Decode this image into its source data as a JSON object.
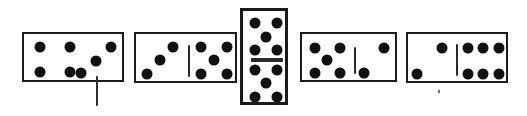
{
  "scene": {
    "width": 527,
    "height": 116,
    "background_color": "#ffffff",
    "ink_color": "#111111",
    "outline_color": "#1a1a1a",
    "title": "Row of five domino tiles",
    "tile_count": 5
  },
  "dominoes": [
    {
      "id": "domino-1",
      "orientation": "horizontal",
      "left_value": 4,
      "right_value": 3,
      "label": "4-3",
      "x": 22,
      "y": 32,
      "width": 102,
      "height": 50,
      "divider": {
        "x": 72,
        "y": 42,
        "length": 30
      },
      "pips": [
        {
          "half": "left",
          "x": 16,
          "y": 13,
          "r": 5.5
        },
        {
          "half": "left",
          "x": 46,
          "y": 13,
          "r": 5.5
        },
        {
          "half": "left",
          "x": 16,
          "y": 38,
          "r": 5.5
        },
        {
          "half": "left",
          "x": 46,
          "y": 38,
          "r": 5.5
        },
        {
          "half": "right",
          "x": 87,
          "y": 13,
          "r": 5.5
        },
        {
          "half": "right",
          "x": 72,
          "y": 27,
          "r": 5.5
        },
        {
          "half": "right",
          "x": 57,
          "y": 39,
          "r": 5.5
        }
      ]
    },
    {
      "id": "domino-2",
      "orientation": "horizontal",
      "left_value": 3,
      "right_value": 5,
      "label": "3-5",
      "x": 134,
      "y": 32,
      "width": 103,
      "height": 51,
      "divider": {
        "x": 52,
        "y": 11,
        "length": 32
      },
      "pips": [
        {
          "half": "left",
          "x": 37,
          "y": 13,
          "r": 5.5
        },
        {
          "half": "left",
          "x": 24,
          "y": 26,
          "r": 5.5
        },
        {
          "half": "left",
          "x": 11,
          "y": 40,
          "r": 5.5
        },
        {
          "half": "right",
          "x": 65,
          "y": 13,
          "r": 5.5
        },
        {
          "half": "right",
          "x": 91,
          "y": 13,
          "r": 5.5
        },
        {
          "half": "right",
          "x": 78,
          "y": 26,
          "r": 5.5
        },
        {
          "half": "right",
          "x": 65,
          "y": 40,
          "r": 5.5
        },
        {
          "half": "right",
          "x": 91,
          "y": 40,
          "r": 5.5
        }
      ]
    },
    {
      "id": "domino-3",
      "orientation": "vertical",
      "left_value": 5,
      "right_value": 5,
      "label": "5-5",
      "x": 240,
      "y": 8,
      "width": 48,
      "height": 97,
      "divider": {
        "x": 8,
        "y": 47,
        "length": 32
      },
      "pips": [
        {
          "half": "top",
          "x": 12,
          "y": 12,
          "r": 5.5
        },
        {
          "half": "top",
          "x": 34,
          "y": 12,
          "r": 5.5
        },
        {
          "half": "top",
          "x": 23,
          "y": 26,
          "r": 5.5
        },
        {
          "half": "top",
          "x": 12,
          "y": 39,
          "r": 5.5
        },
        {
          "half": "top",
          "x": 34,
          "y": 39,
          "r": 5.5
        },
        {
          "half": "bottom",
          "x": 12,
          "y": 59,
          "r": 5.5
        },
        {
          "half": "bottom",
          "x": 34,
          "y": 59,
          "r": 5.5
        },
        {
          "half": "bottom",
          "x": 23,
          "y": 72,
          "r": 5.5
        },
        {
          "half": "bottom",
          "x": 12,
          "y": 86,
          "r": 5.5
        },
        {
          "half": "bottom",
          "x": 34,
          "y": 86,
          "r": 5.5
        }
      ]
    },
    {
      "id": "domino-4",
      "orientation": "horizontal",
      "left_value": 5,
      "right_value": 2,
      "label": "5-2",
      "x": 300,
      "y": 32,
      "width": 97,
      "height": 50,
      "divider": {
        "x": 52,
        "y": 13,
        "length": 27
      },
      "pips": [
        {
          "half": "left",
          "x": 13,
          "y": 14,
          "r": 5.5
        },
        {
          "half": "left",
          "x": 38,
          "y": 14,
          "r": 5.5
        },
        {
          "half": "left",
          "x": 25,
          "y": 26,
          "r": 5.5
        },
        {
          "half": "left",
          "x": 13,
          "y": 39,
          "r": 5.5
        },
        {
          "half": "left",
          "x": 38,
          "y": 39,
          "r": 5.5
        },
        {
          "half": "right",
          "x": 82,
          "y": 14,
          "r": 5.5
        },
        {
          "half": "right",
          "x": 62,
          "y": 39,
          "r": 5.5
        }
      ]
    },
    {
      "id": "domino-5",
      "orientation": "horizontal",
      "left_value": 2,
      "right_value": 6,
      "label": "2-6",
      "x": 406,
      "y": 32,
      "width": 102,
      "height": 51,
      "divider": {
        "x": 48,
        "y": 10,
        "length": 32
      },
      "pips": [
        {
          "half": "left",
          "x": 34,
          "y": 14,
          "r": 5.5
        },
        {
          "half": "left",
          "x": 9,
          "y": 40,
          "r": 5.5
        },
        {
          "half": "right",
          "x": 60,
          "y": 14,
          "r": 5.5
        },
        {
          "half": "right",
          "x": 75,
          "y": 14,
          "r": 5.5
        },
        {
          "half": "right",
          "x": 91,
          "y": 14,
          "r": 5.5
        },
        {
          "half": "right",
          "x": 60,
          "y": 40,
          "r": 5.5
        },
        {
          "half": "right",
          "x": 75,
          "y": 40,
          "r": 5.5
        },
        {
          "half": "right",
          "x": 91,
          "y": 40,
          "r": 5.5
        }
      ]
    }
  ],
  "artifact": {
    "name": "stray-speck",
    "x": 438,
    "y": 90
  }
}
